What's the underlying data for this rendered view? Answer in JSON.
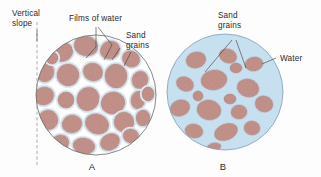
{
  "figure": {
    "background_color": "#fdfdfd",
    "panels": [
      {
        "id": "A",
        "panel_label": "A",
        "description": "Unsaturated sand with films of water around grains, vertical slope at left",
        "circle": {
          "cx": 96,
          "cy": 95,
          "r": 60,
          "fill": "#ffffff",
          "stroke": "#6b6b6b"
        },
        "labels": [
          {
            "name": "vertical-slope",
            "line1": "Vertical",
            "line2": "slope"
          },
          {
            "name": "films-of-water",
            "line1": "Films of water",
            "line2": ""
          },
          {
            "name": "sand-grains",
            "line1": "Sand",
            "line2": "grains"
          }
        ]
      },
      {
        "id": "B",
        "panel_label": "B",
        "description": "Saturated sand fully submerged in water with dispersed grains",
        "circle": {
          "cx": 225,
          "cy": 92,
          "r": 58,
          "fill": "#c6e0f0",
          "stroke": "#6b8ea8"
        },
        "labels": [
          {
            "name": "sand-grains",
            "line1": "Sand",
            "line2": "grains"
          },
          {
            "name": "water",
            "line1": "Water",
            "line2": ""
          }
        ]
      }
    ],
    "colors": {
      "grain_fill": "#c08a81",
      "grain_stroke": "#a8746c",
      "water_fill": "#c6e0f0",
      "water_film": "#dbe9f2",
      "circle_outline_a": "#6b6b6b",
      "circle_outline_b": "#6b8ea8",
      "text": "#2a2a2a",
      "leader": "#3a3a3a",
      "dashed_line": "#8a8a8a"
    },
    "text": {
      "vertical_slope_l1": "Vertical",
      "vertical_slope_l2": "slope",
      "films_of_water": "Films of water",
      "sand_grains_l1_a": "Sand",
      "sand_grains_l2_a": "grains",
      "sand_grains_l1_b": "Sand",
      "sand_grains_l2_b": "grains",
      "water": "Water",
      "panel_a": "A",
      "panel_b": "B"
    },
    "grains_a": [
      {
        "cx": 62,
        "cy": 52,
        "rx": 11,
        "ry": 9.5,
        "rot": -18
      },
      {
        "cx": 86,
        "cy": 46,
        "rx": 12,
        "ry": 10,
        "rot": 12
      },
      {
        "cx": 110,
        "cy": 50,
        "rx": 10,
        "ry": 9,
        "rot": -25
      },
      {
        "cx": 131,
        "cy": 59,
        "rx": 9,
        "ry": 8,
        "rot": 30
      },
      {
        "cx": 45,
        "cy": 72,
        "rx": 9,
        "ry": 10,
        "rot": 8
      },
      {
        "cx": 68,
        "cy": 75,
        "rx": 11,
        "ry": 11,
        "rot": -10
      },
      {
        "cx": 93,
        "cy": 72,
        "rx": 10,
        "ry": 9,
        "rot": 20
      },
      {
        "cx": 116,
        "cy": 76,
        "rx": 11,
        "ry": 12,
        "rot": -5
      },
      {
        "cx": 140,
        "cy": 80,
        "rx": 8,
        "ry": 9,
        "rot": 15
      },
      {
        "cx": 44,
        "cy": 96,
        "rx": 10,
        "ry": 9,
        "rot": -22
      },
      {
        "cx": 66,
        "cy": 100,
        "rx": 8,
        "ry": 8,
        "rot": 0
      },
      {
        "cx": 88,
        "cy": 99,
        "rx": 11,
        "ry": 12,
        "rot": 25
      },
      {
        "cx": 113,
        "cy": 103,
        "rx": 12,
        "ry": 11,
        "rot": -15
      },
      {
        "cx": 138,
        "cy": 100,
        "rx": 7,
        "ry": 9,
        "rot": 10
      },
      {
        "cx": 48,
        "cy": 120,
        "rx": 10,
        "ry": 10,
        "rot": 18
      },
      {
        "cx": 72,
        "cy": 124,
        "rx": 10,
        "ry": 9,
        "rot": -12
      },
      {
        "cx": 97,
        "cy": 124,
        "rx": 12,
        "ry": 10,
        "rot": 22
      },
      {
        "cx": 124,
        "cy": 122,
        "rx": 10,
        "ry": 10,
        "rot": -8
      },
      {
        "cx": 143,
        "cy": 118,
        "rx": 7,
        "ry": 8,
        "rot": 5
      },
      {
        "cx": 60,
        "cy": 143,
        "rx": 9,
        "ry": 8,
        "rot": -20
      },
      {
        "cx": 84,
        "cy": 146,
        "rx": 11,
        "ry": 8,
        "rot": 10
      },
      {
        "cx": 110,
        "cy": 142,
        "rx": 10,
        "ry": 8,
        "rot": -28
      },
      {
        "cx": 131,
        "cy": 136,
        "rx": 8,
        "ry": 7,
        "rot": 16
      },
      {
        "cx": 52,
        "cy": 58,
        "rx": 6,
        "ry": 6,
        "rot": 0
      },
      {
        "cx": 148,
        "cy": 94,
        "rx": 6,
        "ry": 7,
        "rot": 0
      }
    ],
    "grains_b": [
      {
        "cx": 196,
        "cy": 60,
        "rx": 10,
        "ry": 8,
        "rot": -15
      },
      {
        "cx": 228,
        "cy": 56,
        "rx": 9,
        "ry": 7,
        "rot": 20
      },
      {
        "cx": 254,
        "cy": 64,
        "rx": 9,
        "ry": 7,
        "rot": -10
      },
      {
        "cx": 185,
        "cy": 84,
        "rx": 9,
        "ry": 7,
        "rot": 25
      },
      {
        "cx": 214,
        "cy": 80,
        "rx": 13,
        "ry": 10,
        "rot": -8
      },
      {
        "cx": 248,
        "cy": 88,
        "rx": 11,
        "ry": 9,
        "rot": 15
      },
      {
        "cx": 180,
        "cy": 108,
        "rx": 10,
        "ry": 8,
        "rot": -20
      },
      {
        "cx": 209,
        "cy": 110,
        "rx": 12,
        "ry": 10,
        "rot": 10
      },
      {
        "cx": 239,
        "cy": 112,
        "rx": 8,
        "ry": 7,
        "rot": -5
      },
      {
        "cx": 264,
        "cy": 104,
        "rx": 9,
        "ry": 8,
        "rot": 18
      },
      {
        "cx": 194,
        "cy": 131,
        "rx": 9,
        "ry": 7,
        "rot": 12
      },
      {
        "cx": 226,
        "cy": 132,
        "rx": 12,
        "ry": 8,
        "rot": -22
      },
      {
        "cx": 252,
        "cy": 128,
        "rx": 8,
        "ry": 7,
        "rot": 8
      },
      {
        "cx": 214,
        "cy": 147,
        "rx": 7,
        "ry": 4,
        "rot": -10
      },
      {
        "cx": 236,
        "cy": 68,
        "rx": 6,
        "ry": 5,
        "rot": 0
      },
      {
        "cx": 198,
        "cy": 96,
        "rx": 5,
        "ry": 5,
        "rot": 0
      },
      {
        "cx": 230,
        "cy": 99,
        "rx": 6,
        "ry": 5,
        "rot": 0
      }
    ]
  }
}
